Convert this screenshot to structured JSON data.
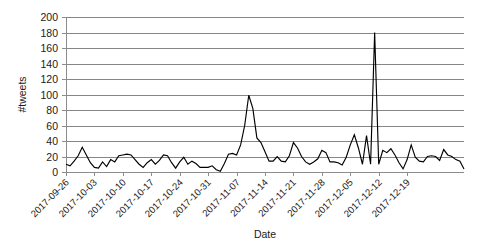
{
  "chart_data": {
    "type": "line",
    "title": "",
    "xlabel": "Date",
    "ylabel": "#tweets",
    "ylim": [
      0,
      200
    ],
    "ytick_step": 20,
    "yticks": [
      0,
      20,
      40,
      60,
      80,
      100,
      120,
      140,
      160,
      180,
      200
    ],
    "xtick_labels": [
      "2017-09-26",
      "2017-10-03",
      "2017-10-10",
      "2017-10-17",
      "2017-10-24",
      "2017-10-31",
      "2017-11-07",
      "2017-11-14",
      "2017-11-21",
      "2017-11-28",
      "2017-12-05",
      "2017-12-12",
      "2017-12-19"
    ],
    "xtick_indices": [
      0,
      7,
      14,
      21,
      28,
      35,
      42,
      49,
      56,
      63,
      70,
      77,
      84
    ],
    "grid": "horizontal",
    "legend": "none",
    "x_start": "2017-09-26",
    "x_end": "2017-12-24",
    "series": [
      {
        "name": "#tweets",
        "values": [
          10,
          8,
          14,
          21,
          32,
          22,
          12,
          6,
          5,
          13,
          7,
          16,
          13,
          21,
          22,
          23,
          22,
          16,
          10,
          6,
          12,
          16,
          10,
          15,
          22,
          21,
          12,
          5,
          13,
          19,
          10,
          14,
          11,
          6,
          6,
          6,
          8,
          3,
          1,
          11,
          23,
          24,
          22,
          35,
          60,
          99,
          82,
          44,
          38,
          26,
          14,
          14,
          20,
          14,
          13,
          21,
          38,
          31,
          20,
          13,
          10,
          13,
          17,
          28,
          25,
          13,
          13,
          12,
          9,
          19,
          35,
          48,
          31,
          10,
          47,
          10,
          180,
          10,
          28,
          25,
          30,
          22,
          12,
          4,
          16,
          35,
          19,
          14,
          13,
          20,
          21,
          20,
          15,
          29,
          22,
          20,
          16,
          14,
          4
        ]
      }
    ]
  },
  "axis_meta": {
    "ylabel_rotated": true,
    "xtick_rotation_deg": -45
  }
}
